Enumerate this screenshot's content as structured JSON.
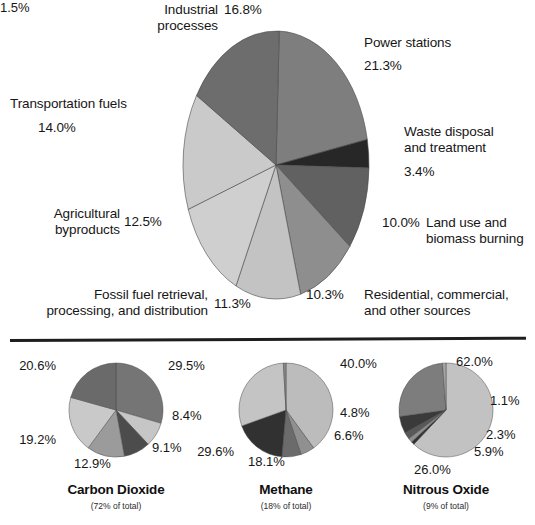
{
  "figure": {
    "divider": "horizontal-rule"
  },
  "chart_data": [
    {
      "type": "pie",
      "id": "global-greenhouse-gas-sources",
      "title": "",
      "legend_position": "callout-labels",
      "categories": [
        "Power stations",
        "Waste disposal and treatment",
        "Land use and biomass burning",
        "Residential, commercial, and other sources",
        "Fossil fuel retrieval, processing, and distribution",
        "Agricultural byproducts",
        "Transportation fuels",
        "Industrial processes"
      ],
      "values": [
        21.3,
        3.4,
        10.0,
        10.3,
        11.3,
        12.5,
        14.0,
        16.8
      ],
      "value_labels": [
        "21.3%",
        "3.4%",
        "10.0%",
        "10.3%",
        "11.3%",
        "12.5%",
        "14.0%",
        "16.8%"
      ],
      "colors": [
        "#7e7e7e",
        "#272727",
        "#616161",
        "#8e8e8e",
        "#c3c3c3",
        "#cfcfcf",
        "#cacaca",
        "#6d6d6d"
      ]
    },
    {
      "type": "pie",
      "id": "carbon-dioxide",
      "title": "Carbon Dioxide",
      "subtitle": "(72% of total)",
      "values": [
        29.5,
        8.4,
        9.1,
        12.9,
        19.2,
        20.6
      ],
      "value_labels": [
        "29.5%",
        "8.4%",
        "9.1%",
        "12.9%",
        "19.2%",
        "20.6%"
      ],
      "colors": [
        "#757575",
        "#c6c6c6",
        "#4c4c4c",
        "#9b9b9b",
        "#c9c9c9",
        "#6a6a6a"
      ]
    },
    {
      "type": "pie",
      "id": "methane",
      "title": "Methane",
      "subtitle": "(18% of total)",
      "values": [
        40.0,
        4.8,
        6.6,
        18.1,
        29.6,
        0.9
      ],
      "value_labels": [
        "40.0%",
        "4.8%",
        "6.6%",
        "18.1%",
        "29.6%"
      ],
      "colors": [
        "#bcbcbc",
        "#909090",
        "#6b6b6b",
        "#313131",
        "#c4c4c4",
        "#8a8a8a"
      ]
    },
    {
      "type": "pie",
      "id": "nitrous-oxide",
      "title": "Nitrous Oxide",
      "subtitle": "(9% of total)",
      "values": [
        62.0,
        1.1,
        1.5,
        2.3,
        5.9,
        26.0,
        1.2
      ],
      "value_labels": [
        "62.0%",
        "1.1%",
        "1.5%",
        "2.3%",
        "5.9%",
        "26.0%"
      ],
      "colors": [
        "#c2c2c2",
        "#323232",
        "#8e8e8e",
        "#585858",
        "#3a3a3a",
        "#7d7d7d",
        "#a5a5a5"
      ]
    }
  ],
  "main": {
    "labels": {
      "industrial_processes": "Industrial\nprocesses",
      "industrial_processes_value": "16.8%",
      "power_stations": "Power stations",
      "power_stations_value": "21.3%",
      "transportation_fuels": "Transportation fuels",
      "transportation_fuels_value": "14.0%",
      "waste_disposal": "Waste disposal\nand treatment",
      "waste_disposal_value": "3.4%",
      "agricultural_byproducts": "Agricultural\nbyproducts",
      "agricultural_byproducts_value": "12.5%",
      "land_use": "Land use and\nbiomass burning",
      "land_use_value": "10.0%",
      "fossil_fuel": "Fossil fuel retrieval,\nprocessing, and distribution",
      "fossil_fuel_value": "11.3%",
      "residential": "Residential, commercial,\nand other sources",
      "residential_value": "10.3%"
    }
  },
  "small": {
    "co2": {
      "title": "Carbon Dioxide",
      "subtitle": "(72% of total)",
      "v1": "29.5%",
      "v2": "8.4%",
      "v3": "9.1%",
      "v4": "12.9%",
      "v5": "19.2%",
      "v6": "20.6%"
    },
    "ch4": {
      "title": "Methane",
      "subtitle": "(18% of total)",
      "v1": "40.0%",
      "v2": "4.8%",
      "v3": "6.6%",
      "v4": "18.1%",
      "v5": "29.6%"
    },
    "n2o": {
      "title": "Nitrous Oxide",
      "subtitle": "(9% of total)",
      "v1": "62.0%",
      "v2": "1.1%",
      "v3": "1.5%",
      "v4": "2.3%",
      "v5": "5.9%",
      "v6": "26.0%"
    }
  }
}
